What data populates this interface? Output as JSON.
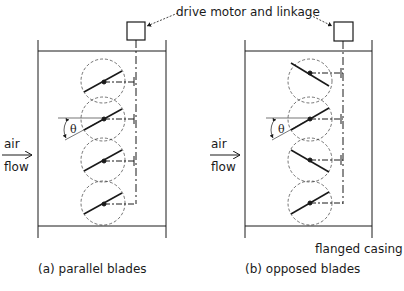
{
  "diagram": {
    "callouts": {
      "drive": "drive motor and linkage",
      "casing": "flanged casing"
    },
    "panels": [
      {
        "id": "a",
        "caption": "(a) parallel blades",
        "air_label": "air",
        "flow_label": "flow",
        "angle_label": "θ",
        "blade_orientation": [
          "parallel",
          "parallel",
          "parallel",
          "parallel"
        ]
      },
      {
        "id": "b",
        "caption": "(b) opposed blades",
        "air_label": "air",
        "flow_label": "flow",
        "angle_label": "θ",
        "blade_orientation": [
          "down",
          "up",
          "down",
          "up"
        ]
      }
    ]
  }
}
